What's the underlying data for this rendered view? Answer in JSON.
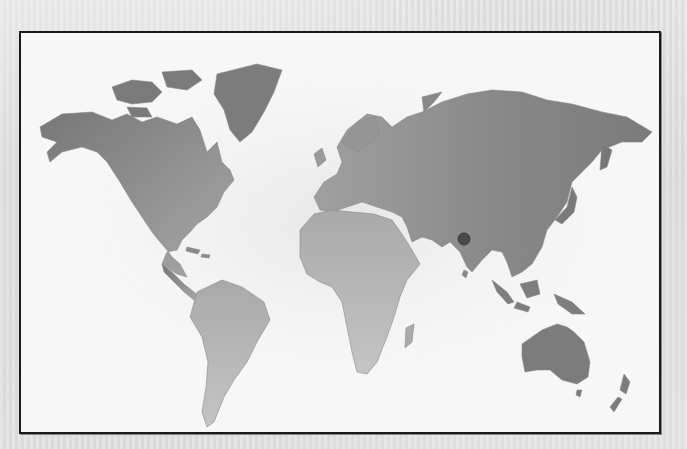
{
  "map": {
    "type": "world-map",
    "style": "grayscale",
    "marker": {
      "name": "location-marker",
      "region": "India",
      "x": 462,
      "y": 237,
      "radius": 6,
      "color": "#4a4a4a"
    },
    "colors": {
      "frame_border": "#1a1a1a",
      "map_background": "#f7f7f7",
      "land_dark": "#7e7e7e",
      "land_light": "#b8b8b8"
    },
    "continents": [
      "North America",
      "Greenland",
      "South America",
      "Europe",
      "Asia",
      "Africa",
      "Australia",
      "New Zealand"
    ]
  }
}
